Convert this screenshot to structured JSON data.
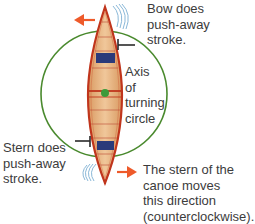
{
  "diagram": {
    "labels": {
      "bow": {
        "lines": [
          "Bow does",
          "push-away",
          "stroke."
        ]
      },
      "stern": {
        "lines": [
          "Stern does",
          "push-away",
          "stroke."
        ]
      },
      "axis": {
        "lines": [
          "Axis",
          "of",
          "turning",
          "circle"
        ]
      },
      "direction": {
        "lines": [
          "The stern of the",
          "canoe moves",
          "this direction",
          "(counterclockwise)."
        ]
      }
    },
    "elements": {
      "turning_circle": {
        "color": "#4a8a2e"
      },
      "canoe": {
        "hull_color": "#e7b88a",
        "gunwale_color": "#c0351c",
        "seat_color": "#2b3a7a"
      },
      "axis_dot": {
        "color": "#3e9a3a"
      },
      "bow_arrow": {
        "direction": "left",
        "color": "#ee5a2a"
      },
      "stern_arrow": {
        "direction": "right",
        "color": "#ee5a2a"
      },
      "paddle_markers": {
        "color": "#2a2a2a"
      },
      "water_ripples": {
        "color": "#8ab8d8"
      }
    }
  }
}
